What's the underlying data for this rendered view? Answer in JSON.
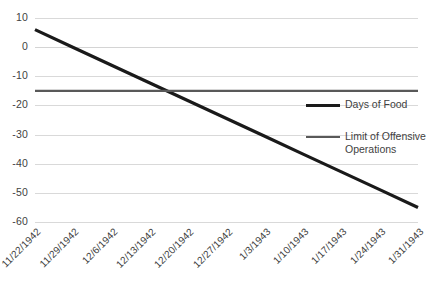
{
  "chart_data": {
    "type": "line",
    "title": "",
    "xlabel": "",
    "ylabel": "",
    "ylim": [
      -60,
      10
    ],
    "ytick_step": 10,
    "grid": true,
    "legend_position": "right-middle",
    "categories": [
      "11/22/1942",
      "11/29/1942",
      "12/6/1942",
      "12/13/1942",
      "12/20/1942",
      "12/27/1942",
      "1/3/1943",
      "1/10/1943",
      "1/17/1943",
      "1/24/1943",
      "1/31/1943"
    ],
    "ytick_labels": [
      "10",
      "0",
      "-10",
      "-20",
      "-30",
      "-40",
      "-50",
      "-60"
    ],
    "ytick_values": [
      10,
      0,
      -10,
      -20,
      -30,
      -40,
      -50,
      -60
    ],
    "series": [
      {
        "name": "Days of Food",
        "color": "#1a1a1a",
        "width": 3.2,
        "values": [
          6,
          -0.1,
          -6.2,
          -12.3,
          -18.4,
          -24.5,
          -30.6,
          -36.7,
          -42.8,
          -48.9,
          -55
        ]
      },
      {
        "name": "Limit of Offensive Operations",
        "color": "#595959",
        "width": 2.2,
        "values": [
          -15,
          -15,
          -15,
          -15,
          -15,
          -15,
          -15,
          -15,
          -15,
          -15,
          -15
        ]
      }
    ],
    "legend": [
      {
        "label": "Days of Food",
        "color": "#1a1a1a",
        "width": 3.2
      },
      {
        "label": "Limit of Offensive Operations",
        "color": "#595959",
        "width": 2.2
      }
    ],
    "colors": {
      "grid": "#d9d9d9",
      "text": "#3f3f3f",
      "background": "#ffffff"
    }
  }
}
